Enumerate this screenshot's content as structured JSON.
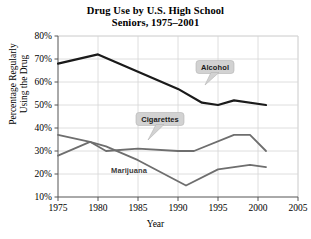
{
  "chart_data": {
    "type": "line",
    "title": "Drug Use by U.S. High School Seniors, 1975–2001",
    "title_line1": "Drug Use by U.S. High School",
    "title_line2": "Seniors, 1975–2001",
    "xlabel": "Year",
    "ylabel": "Percentage Regularly Using the Drug",
    "ylabel_line1": "Percentage Regularly",
    "ylabel_line2": "Using the Drug",
    "xlim": [
      1975,
      2005
    ],
    "ylim": [
      10,
      80
    ],
    "xticks": [
      "1975",
      "1980",
      "1985",
      "1990",
      "1995",
      "2000",
      "2005"
    ],
    "xtick_values": [
      1975,
      1980,
      1985,
      1990,
      1995,
      2000,
      2005
    ],
    "yticks": [
      "10%",
      "20%",
      "30%",
      "40%",
      "50%",
      "60%",
      "70%",
      "80%"
    ],
    "ytick_values": [
      10,
      20,
      30,
      40,
      50,
      60,
      70,
      80
    ],
    "grid": true,
    "legend_position": "inline-callouts",
    "series": [
      {
        "name": "Alcohol",
        "color": "#1a1a1a",
        "label_style": "callout",
        "x": [
          1975,
          1980,
          1990,
          1993,
          1995,
          1997,
          2001
        ],
        "values": [
          68,
          72,
          57,
          51,
          50,
          52,
          50
        ]
      },
      {
        "name": "Cigarettes",
        "color": "#6e6e6e",
        "label_style": "callout",
        "x": [
          1975,
          1979,
          1981,
          1985,
          1990,
          1992,
          1997,
          1999,
          2001
        ],
        "values": [
          37,
          34,
          30,
          31,
          30,
          30,
          37,
          37,
          30
        ]
      },
      {
        "name": "Marijuana",
        "color": "#6e6e6e",
        "label_style": "plain",
        "x": [
          1975,
          1979,
          1981,
          1985,
          1991,
          1995,
          1999,
          2001
        ],
        "values": [
          28,
          34,
          32,
          26,
          15,
          22,
          24,
          23
        ]
      }
    ]
  },
  "callouts": [
    {
      "label": "Alcohol"
    },
    {
      "label": "Cigarettes"
    },
    {
      "label": "Marijuana"
    }
  ]
}
